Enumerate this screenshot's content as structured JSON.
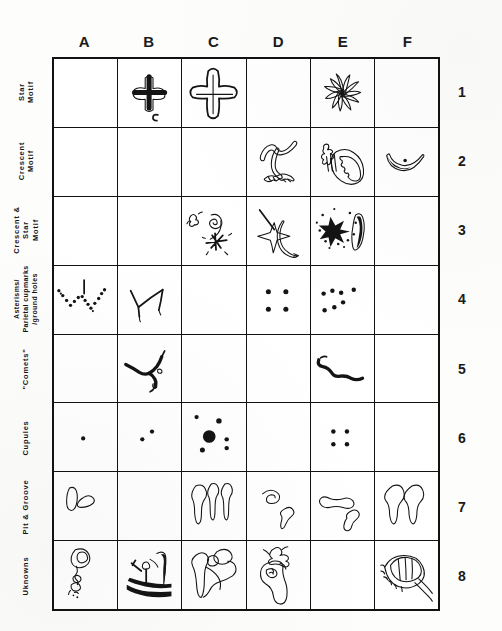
{
  "figure": {
    "kind": "petroglyph-motif-classification-table",
    "columns": [
      "A",
      "B",
      "C",
      "D",
      "E",
      "F"
    ],
    "row_numbers": [
      "1",
      "2",
      "3",
      "4",
      "5",
      "6",
      "7",
      "8"
    ],
    "row_labels": [
      "Star\nMotif",
      "Crescent\nMotif",
      "Crescent &\nStar\nMotif",
      "Asterisms/\nParietal cupmarks\n/ground holes",
      "\"Comets\"",
      "Cupules",
      "Pit & Groove",
      "Uknowns"
    ],
    "ink_color": "#141414",
    "background_color": "#ffffff"
  },
  "cells": [
    {
      "row": "1",
      "col": "A",
      "motif": "empty"
    },
    {
      "row": "1",
      "col": "B",
      "motif": "thick-outlined-cross"
    },
    {
      "row": "1",
      "col": "C",
      "motif": "large-outlined-cross"
    },
    {
      "row": "1",
      "col": "D",
      "motif": "empty"
    },
    {
      "row": "1",
      "col": "E",
      "motif": "radiating-starburst"
    },
    {
      "row": "1",
      "col": "F",
      "motif": "empty"
    },
    {
      "row": "2",
      "col": "A",
      "motif": "empty"
    },
    {
      "row": "2",
      "col": "B",
      "motif": "empty"
    },
    {
      "row": "2",
      "col": "C",
      "motif": "empty"
    },
    {
      "row": "2",
      "col": "D",
      "motif": "hooked-crescent-with-base"
    },
    {
      "row": "2",
      "col": "E",
      "motif": "crested-crescent-figure"
    },
    {
      "row": "2",
      "col": "F",
      "motif": "smile-crescent-with-dot"
    },
    {
      "row": "3",
      "col": "A",
      "motif": "empty"
    },
    {
      "row": "3",
      "col": "B",
      "motif": "empty"
    },
    {
      "row": "3",
      "col": "C",
      "motif": "spiral-and-starburst"
    },
    {
      "row": "3",
      "col": "D",
      "motif": "four-point-star-with-crescent"
    },
    {
      "row": "3",
      "col": "E",
      "motif": "pecked-star-and-crescent"
    },
    {
      "row": "3",
      "col": "F",
      "motif": "empty"
    },
    {
      "row": "4",
      "col": "A",
      "motif": "dotted-w-asterism-with-bar"
    },
    {
      "row": "4",
      "col": "B",
      "motif": "line-w-asterism"
    },
    {
      "row": "4",
      "col": "C",
      "motif": "empty"
    },
    {
      "row": "4",
      "col": "D",
      "motif": "four-cupmark-square"
    },
    {
      "row": "4",
      "col": "E",
      "motif": "seven-cupmark-cluster"
    },
    {
      "row": "4",
      "col": "F",
      "motif": "empty"
    },
    {
      "row": "5",
      "col": "A",
      "motif": "empty"
    },
    {
      "row": "5",
      "col": "B",
      "motif": "forked-comet-tail"
    },
    {
      "row": "5",
      "col": "C",
      "motif": "empty"
    },
    {
      "row": "5",
      "col": "D",
      "motif": "empty"
    },
    {
      "row": "5",
      "col": "E",
      "motif": "wavy-comet-streak"
    },
    {
      "row": "5",
      "col": "F",
      "motif": "empty"
    },
    {
      "row": "6",
      "col": "A",
      "motif": "single-cupule"
    },
    {
      "row": "6",
      "col": "B",
      "motif": "two-cupules"
    },
    {
      "row": "6",
      "col": "C",
      "motif": "large-cupule-with-satellites"
    },
    {
      "row": "6",
      "col": "D",
      "motif": "empty"
    },
    {
      "row": "6",
      "col": "E",
      "motif": "four-cupules"
    },
    {
      "row": "6",
      "col": "F",
      "motif": "empty"
    },
    {
      "row": "7",
      "col": "A",
      "motif": "pit-and-groove-pair"
    },
    {
      "row": "7",
      "col": "B",
      "motif": "empty"
    },
    {
      "row": "7",
      "col": "C",
      "motif": "three-tadpole-grooves"
    },
    {
      "row": "7",
      "col": "D",
      "motif": "two-hooked-grooves"
    },
    {
      "row": "7",
      "col": "E",
      "motif": "bent-groove-and-dumbbell"
    },
    {
      "row": "7",
      "col": "F",
      "motif": "two-teardrop-grooves"
    },
    {
      "row": "8",
      "col": "A",
      "motif": "ringed-head-figure"
    },
    {
      "row": "8",
      "col": "B",
      "motif": "pecked-boat-like-figure"
    },
    {
      "row": "8",
      "col": "C",
      "motif": "interlocked-loop-figure"
    },
    {
      "row": "8",
      "col": "D",
      "motif": "antlered-enclosure-figure"
    },
    {
      "row": "8",
      "col": "E",
      "motif": "empty"
    },
    {
      "row": "8",
      "col": "F",
      "motif": "coiled-ring-with-tail"
    }
  ]
}
